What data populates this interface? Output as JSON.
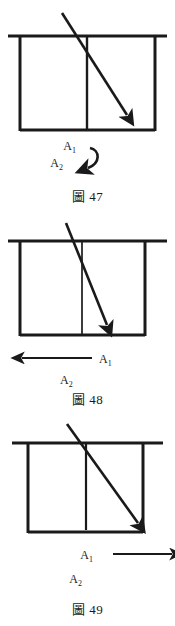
{
  "document": {
    "type": "physics-diagram-sheet",
    "background_color": "#ffffff",
    "ink_color": "#1a1a1a",
    "figure_count": 3
  },
  "figures": [
    {
      "id": "fig47",
      "caption": "圖 47",
      "caption_number": "47",
      "labels": {
        "a1": "A",
        "a1_sub": "1",
        "a2": "A",
        "a2_sub": "2"
      },
      "indicator": {
        "kind": "curved-hook-arrow",
        "direction": "clockwise-down-left",
        "description": "curved arrow sweeping from upper right down to lower left"
      },
      "ray": {
        "kind": "diagonal-arrow",
        "entry": "upper-left",
        "terminates": "inside-box-lower-right",
        "slope_description": "shallow diagonal, arrowhead stops short of right wall"
      }
    },
    {
      "id": "fig48",
      "caption": "圖 48",
      "caption_number": "48",
      "labels": {
        "a1": "A",
        "a1_sub": "1",
        "a2": "A",
        "a2_sub": "2"
      },
      "indicator": {
        "kind": "straight-arrow",
        "direction": "left",
        "description": "horizontal arrow pointing left with A1 at its right end"
      },
      "ray": {
        "kind": "diagonal-arrow",
        "entry": "upper-left",
        "terminates": "inside-box-lower-middle",
        "slope_description": "steep diagonal, crosses divider near bottom"
      }
    },
    {
      "id": "fig49",
      "caption": "圖 49",
      "caption_number": "49",
      "labels": {
        "a1": "A",
        "a1_sub": "1",
        "a2": "A",
        "a2_sub": "2"
      },
      "indicator": {
        "kind": "straight-arrow",
        "direction": "right",
        "description": "horizontal arrow pointing right with A1 at its left end"
      },
      "ray": {
        "kind": "diagonal-arrow",
        "entry": "upper-left",
        "terminates": "at-right-wall",
        "slope_description": "diagonal reaching the lower right corner region"
      }
    }
  ]
}
